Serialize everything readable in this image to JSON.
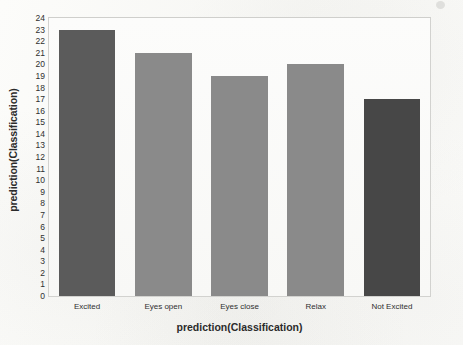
{
  "chart_data": {
    "type": "bar",
    "title": "",
    "categories": [
      "Excited",
      "Eyes open",
      "Eyes close",
      "Relax",
      "Not Excited"
    ],
    "values": [
      23,
      21,
      19,
      20,
      17
    ],
    "series": [
      {
        "name": "prediction(Classification)",
        "values": [
          23,
          21,
          19,
          20,
          17
        ]
      }
    ],
    "bar_colors": [
      "#5b5b5b",
      "#8a8a8a",
      "#8a8a8a",
      "#8a8a8a",
      "#474747"
    ],
    "xlabel": "prediction(Classification)",
    "ylabel": "prediction(Classification)",
    "ylim": [
      0,
      24
    ],
    "ytick_step": 1,
    "yticks": [
      24,
      23,
      22,
      21,
      20,
      19,
      18,
      17,
      16,
      15,
      14,
      13,
      12,
      11,
      10,
      9,
      8,
      7,
      6,
      5,
      4,
      3,
      2,
      1,
      0
    ],
    "grid": false,
    "legend": "none",
    "plot_border_color": "#d2d2cf",
    "plot_background": "#fbfbfa"
  }
}
